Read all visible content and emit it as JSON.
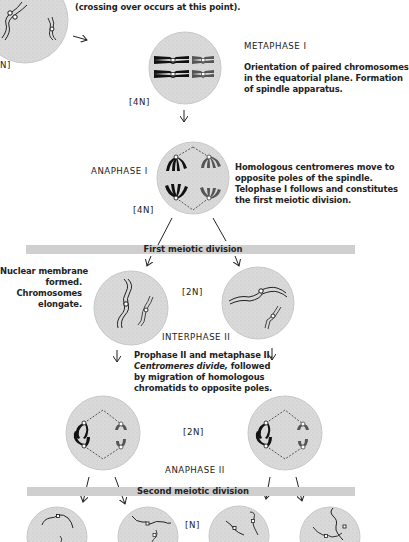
{
  "top": {
    "caption": "(crossing over occurs at this point).",
    "ploidy_partial": "N]"
  },
  "metaphase1": {
    "title": "METAPHASE I",
    "description_lines": [
      "Orientation of paired chromosomes",
      "in the equatorial plane. Formation",
      "of spindle apparatus."
    ],
    "ploidy": "[4N]"
  },
  "anaphase1": {
    "title": "ANAPHASE I",
    "description_lines": [
      "Homologous centromeres move to",
      "opposite poles of the spindle.",
      "Telophase I follows and constitutes",
      "the first meiotic division."
    ],
    "ploidy": "[4N]"
  },
  "first_division": {
    "label": "First meiotic division"
  },
  "interphase2": {
    "left_note_lines": [
      "Nuclear membrane",
      "formed.",
      "Chromosomes",
      "elongate."
    ],
    "ploidy": "[2N]",
    "title": "INTERPHASE II",
    "description_lines": [
      "Prophase II and metaphase II.",
      "Centromeres divide,",
      " followed",
      "by migration of homologous",
      "chromatids to opposite poles."
    ]
  },
  "anaphase2": {
    "ploidy": "[2N]",
    "title": "ANAPHASE II"
  },
  "second_division": {
    "label": "Second meiotic division"
  },
  "final": {
    "ploidy": "[N]"
  },
  "colors": {
    "cell_fill": "#d8d8d8",
    "cell_stroke": "#c4c4c4",
    "chromosome_dark": "#111111",
    "chromosome_gray": "#555555",
    "bar": "#cfcfcf"
  }
}
